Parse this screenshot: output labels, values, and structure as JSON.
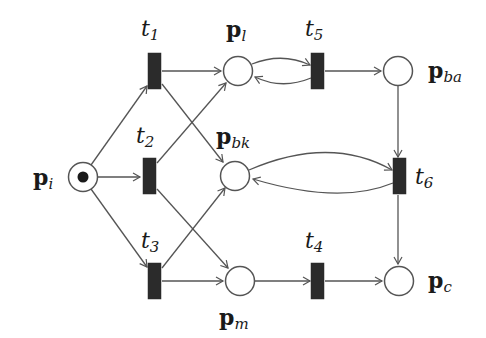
{
  "diagram": {
    "type": "petri-net",
    "colors": {
      "stroke": "#555555",
      "transition_fill": "#2b2b2b",
      "place_fill": "#ffffff",
      "token": "#1a1a1a",
      "background": "#ffffff"
    },
    "places": [
      {
        "id": "p_i",
        "base": "p",
        "sub": "i",
        "cx": 83,
        "cy": 177,
        "tokens": 1
      },
      {
        "id": "p_l",
        "base": "p",
        "sub": "l",
        "cx": 238,
        "cy": 71,
        "tokens": 0
      },
      {
        "id": "p_bk",
        "base": "p",
        "sub": "bk",
        "cx": 235,
        "cy": 176,
        "tokens": 0
      },
      {
        "id": "p_m",
        "base": "p",
        "sub": "m",
        "cx": 240,
        "cy": 281,
        "tokens": 0
      },
      {
        "id": "p_ba",
        "base": "p",
        "sub": "ba",
        "cx": 398,
        "cy": 71,
        "tokens": 0
      },
      {
        "id": "p_c",
        "base": "p",
        "sub": "c",
        "cx": 399,
        "cy": 281,
        "tokens": 0
      }
    ],
    "transitions": [
      {
        "id": "t1",
        "base": "t",
        "sub": "1",
        "cx": 155,
        "cy": 71
      },
      {
        "id": "t2",
        "base": "t",
        "sub": "2",
        "cx": 150,
        "cy": 176
      },
      {
        "id": "t3",
        "base": "t",
        "sub": "3",
        "cx": 155,
        "cy": 281
      },
      {
        "id": "t4",
        "base": "t",
        "sub": "4",
        "cx": 318,
        "cy": 281
      },
      {
        "id": "t5",
        "base": "t",
        "sub": "5",
        "cx": 318,
        "cy": 71
      },
      {
        "id": "t6",
        "base": "t",
        "sub": "6",
        "cx": 400,
        "cy": 176
      }
    ],
    "arcs": [
      {
        "from": "p_i",
        "to": "t1"
      },
      {
        "from": "p_i",
        "to": "t2"
      },
      {
        "from": "p_i",
        "to": "t3"
      },
      {
        "from": "t1",
        "to": "p_l"
      },
      {
        "from": "t1",
        "to": "p_bk"
      },
      {
        "from": "t2",
        "to": "p_l"
      },
      {
        "from": "t2",
        "to": "p_m"
      },
      {
        "from": "t3",
        "to": "p_bk"
      },
      {
        "from": "t3",
        "to": "p_m"
      },
      {
        "from": "p_l",
        "to": "t5",
        "curved": true
      },
      {
        "from": "t5",
        "to": "p_l",
        "curved": true
      },
      {
        "from": "t5",
        "to": "p_ba"
      },
      {
        "from": "p_ba",
        "to": "t6"
      },
      {
        "from": "p_bk",
        "to": "t6",
        "curved": true
      },
      {
        "from": "t6",
        "to": "p_bk",
        "curved": true
      },
      {
        "from": "t6",
        "to": "p_c"
      },
      {
        "from": "p_m",
        "to": "t4"
      },
      {
        "from": "t4",
        "to": "p_c"
      }
    ]
  },
  "labels": {
    "t1": {
      "base": "t",
      "sub": "1"
    },
    "t2": {
      "base": "t",
      "sub": "2"
    },
    "t3": {
      "base": "t",
      "sub": "3"
    },
    "t4": {
      "base": "t",
      "sub": "4"
    },
    "t5": {
      "base": "t",
      "sub": "5"
    },
    "t6": {
      "base": "t",
      "sub": "6"
    },
    "p_i": {
      "base": "p",
      "sub": "i"
    },
    "p_l": {
      "base": "p",
      "sub": "l"
    },
    "p_bk": {
      "base": "p",
      "sub": "bk"
    },
    "p_m": {
      "base": "p",
      "sub": "m"
    },
    "p_ba": {
      "base": "p",
      "sub": "ba"
    },
    "p_c": {
      "base": "p",
      "sub": "c"
    }
  }
}
